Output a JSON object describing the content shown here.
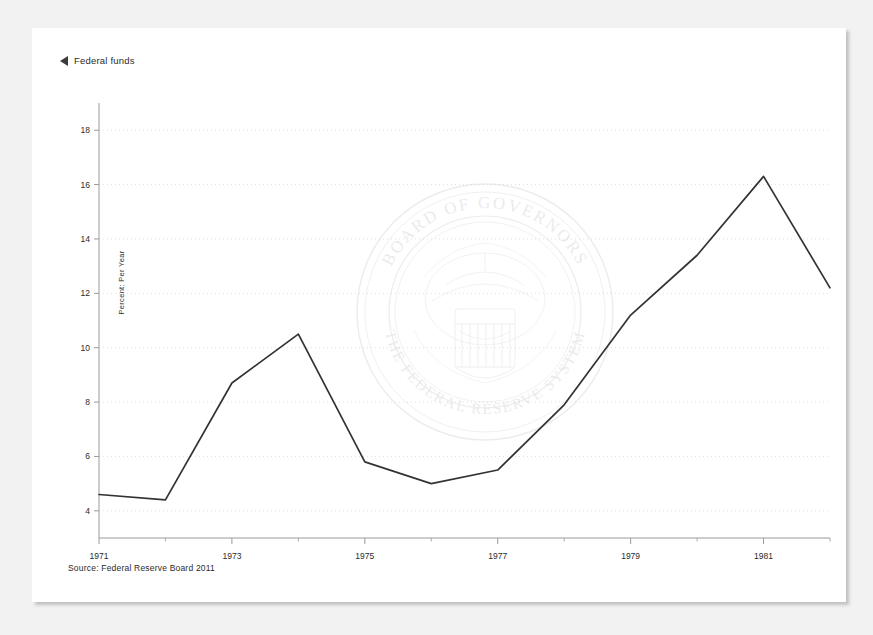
{
  "legend": {
    "marker_icon": "left-triangle-icon",
    "label": "Federal funds"
  },
  "caption": {
    "source": "Source: Federal Reserve Board 2011"
  },
  "watermark": {
    "outer_text_top": "BOARD OF GOVERNORS",
    "outer_text_bottom": "THE FEDERAL RESERVE SYSTEM",
    "description": "federal-reserve-seal"
  },
  "style": {
    "line_color": "#333333",
    "grid_color": "#d8d8d8",
    "axis_color": "#9a9a9a",
    "frame_color": "#5a5a5a",
    "page_background": "#f2f2f2",
    "plot_background": "#ffffff",
    "text_color": "#2b2b2b"
  },
  "chart_data": {
    "type": "line",
    "title": "",
    "subtitle": "",
    "xlabel": "",
    "ylabel": "Percent: Per Year",
    "xlim": [
      1971,
      1982
    ],
    "ylim": [
      3,
      19
    ],
    "grid": true,
    "legend_position": "top-left",
    "y_ticks": [
      4,
      6,
      8,
      10,
      12,
      14,
      16,
      18
    ],
    "y_tick_labels": [
      "4",
      "6",
      "8",
      "10",
      "12",
      "14",
      "16",
      "18"
    ],
    "x_ticks": [
      1971,
      1973,
      1975,
      1977,
      1979,
      1981
    ],
    "x_tick_labels": [
      "1971",
      "1973",
      "1975",
      "1977",
      "1979",
      "1981"
    ],
    "x_minor_ticks": [
      1972,
      1974,
      1976,
      1978,
      1980,
      1982
    ],
    "x": [
      1971,
      1972,
      1973,
      1974,
      1975,
      1976,
      1977,
      1978,
      1979,
      1980,
      1981,
      1982
    ],
    "series": [
      {
        "name": "Federal funds",
        "values": [
          4.6,
          4.4,
          8.7,
          10.5,
          5.8,
          5.0,
          5.5,
          7.9,
          11.2,
          13.4,
          16.3,
          12.2
        ]
      }
    ]
  }
}
